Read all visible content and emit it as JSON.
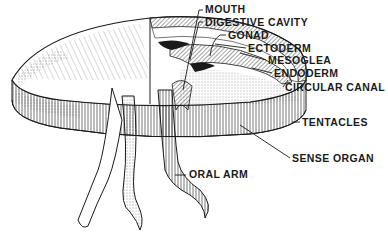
{
  "diagram": {
    "colors": {
      "ink": "#1a1a1a",
      "background": "#ffffff"
    },
    "labels": [
      {
        "id": "mouth",
        "text": "MOUTH"
      },
      {
        "id": "digestive-cavity",
        "text": "DIGESTIVE CAVITY"
      },
      {
        "id": "gonad",
        "text": "GONAD"
      },
      {
        "id": "ectoderm",
        "text": "ECTODERM"
      },
      {
        "id": "mesoglea",
        "text": "MESOGLEA"
      },
      {
        "id": "endoderm",
        "text": "ENDODERM"
      },
      {
        "id": "circular-canal",
        "text": "CIRCULAR CANAL"
      },
      {
        "id": "tentacles",
        "text": "TENTACLES"
      },
      {
        "id": "sense-organ",
        "text": "SENSE ORGAN"
      },
      {
        "id": "oral-arm",
        "text": "ORAL ARM"
      }
    ]
  }
}
